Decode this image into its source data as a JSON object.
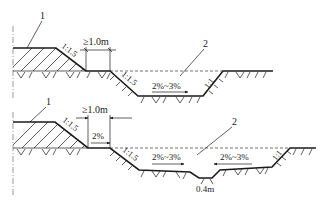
{
  "figure": {
    "line_color": "#1a1a1a",
    "background": "#ffffff"
  },
  "top_section": {
    "label_embankment": "1",
    "label_ditch": "2",
    "embankment_slope": "1:1.5",
    "berm_width": "≥1.0m",
    "ditch_inner_slope": "1:1.5",
    "ditch_outer_slope": "1:1",
    "bottom_gradient": "2%~3%"
  },
  "bottom_section": {
    "label_embankment": "1",
    "label_ditch": "2",
    "embankment_slope": "1:1.5",
    "berm_width": "≥1.0m",
    "berm_gradient": "2%",
    "ditch_inner_slope": "1:1.5",
    "ditch_outer_slope": "1:1",
    "bottom_gradient_left": "2%~3%",
    "bottom_gradient_right": "2%~3%",
    "center_channel_width": "0.4m"
  }
}
